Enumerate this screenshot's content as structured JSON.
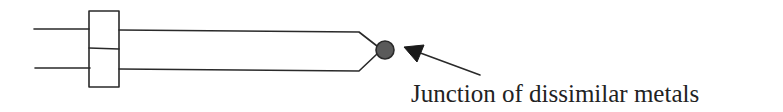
{
  "diagram": {
    "label": "Junction of dissimilar metals",
    "colors": {
      "line": "#2a2a2a",
      "junction_fill": "#5a5a5a",
      "background": "#ffffff",
      "text": "#222222"
    },
    "components": [
      {
        "name": "wire-top-left",
        "type": "wire"
      },
      {
        "name": "wire-bottom-left",
        "type": "wire"
      },
      {
        "name": "terminal-block",
        "type": "connector",
        "sections": 2
      },
      {
        "name": "wire-top-right",
        "type": "wire"
      },
      {
        "name": "wire-bottom-right",
        "type": "wire"
      },
      {
        "name": "junction",
        "type": "bead"
      },
      {
        "name": "pointer-arrow",
        "type": "arrow"
      }
    ]
  }
}
